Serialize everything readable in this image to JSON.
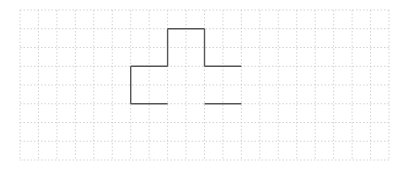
{
  "diagram": {
    "type": "grid-figure",
    "grid": {
      "origin_x": 20,
      "origin_y": 10,
      "cols": 20,
      "rows": 8,
      "cell_w": 18.45,
      "cell_h": 18.75,
      "line_color": "#c8c8c8",
      "line_style": "dotted"
    },
    "figure": {
      "stroke_color": "#555555",
      "stroke_width": 1.4,
      "segments_in_cells": [
        [
          8,
          1,
          10,
          1
        ],
        [
          8,
          1,
          8,
          3
        ],
        [
          10,
          1,
          10,
          3
        ],
        [
          6,
          3,
          8,
          3
        ],
        [
          10,
          3,
          12,
          3
        ],
        [
          6,
          3,
          6,
          5
        ],
        [
          6,
          5,
          8,
          5
        ],
        [
          10,
          5,
          12,
          5
        ]
      ]
    }
  }
}
